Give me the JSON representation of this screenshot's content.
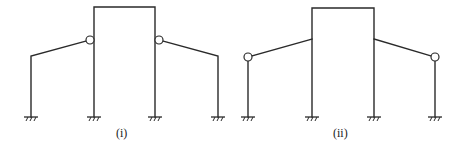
{
  "diagrams": [
    {
      "label": "(i)",
      "description": "Frame with central tall portal; side columns connected by inclined members with hinges at the central columns",
      "hinges_at": "central-columns"
    },
    {
      "label": "(ii)",
      "description": "Frame with central tall portal; side columns topped by hinges, inclined members rigidly joined to central columns",
      "hinges_at": "outer-columns"
    }
  ],
  "colors": {
    "line": "#2a2a2a",
    "background": "#ffffff"
  }
}
